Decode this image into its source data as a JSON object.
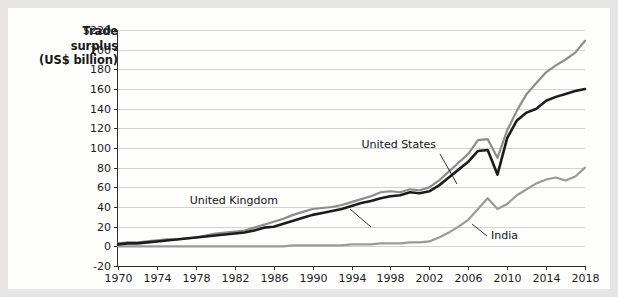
{
  "figure": {
    "axis_title_lines": [
      "Trade",
      "surplus",
      "(US$ billion)"
    ],
    "axis_title_text": "Trade surplus (US$ billion)",
    "background_color": "#e6e5e3",
    "panel_color": "#fdfdfc"
  },
  "chart_data": {
    "type": "line",
    "title": "",
    "subtitle": "",
    "xlabel": "",
    "ylabel": "Trade surplus (US$ billion)",
    "xlim": [
      1970,
      2018
    ],
    "ylim": [
      -20,
      220
    ],
    "grid": true,
    "grid_axis": "y",
    "legend": "inline-annotations",
    "legend_position": "in-plot",
    "x_tick_labels": [
      "1970",
      "1974",
      "1978",
      "1982",
      "1986",
      "1990",
      "1994",
      "1998",
      "2002",
      "2006",
      "2010",
      "2014",
      "2018"
    ],
    "x_ticks": [
      1970,
      1974,
      1978,
      1982,
      1986,
      1990,
      1994,
      1998,
      2002,
      2006,
      2010,
      2014,
      2018
    ],
    "y_tick_labels": [
      "$220",
      "200",
      "180",
      "160",
      "140",
      "120",
      "100",
      "80",
      "60",
      "40",
      "20",
      "0",
      "-20"
    ],
    "y_ticks": [
      220,
      200,
      180,
      160,
      140,
      120,
      100,
      80,
      60,
      40,
      20,
      0,
      -20
    ],
    "x": [
      1970,
      1971,
      1972,
      1973,
      1974,
      1975,
      1976,
      1977,
      1978,
      1979,
      1980,
      1981,
      1982,
      1983,
      1984,
      1985,
      1986,
      1987,
      1988,
      1989,
      1990,
      1991,
      1992,
      1993,
      1994,
      1995,
      1996,
      1997,
      1998,
      1999,
      2000,
      2001,
      2002,
      2003,
      2004,
      2005,
      2006,
      2007,
      2008,
      2009,
      2010,
      2011,
      2012,
      2013,
      2014,
      2015,
      2016,
      2017,
      2018
    ],
    "series": [
      {
        "name": "United States",
        "color": "#8c8c8c",
        "label_annotation": "United States",
        "values": [
          3,
          4,
          4,
          5,
          6,
          7,
          7,
          8,
          9,
          11,
          13,
          14,
          15,
          16,
          19,
          22,
          25,
          28,
          32,
          35,
          38,
          39,
          40,
          42,
          45,
          48,
          51,
          55,
          56,
          55,
          58,
          57,
          60,
          67,
          76,
          85,
          94,
          108,
          109,
          90,
          118,
          138,
          155,
          166,
          177,
          184,
          190,
          197,
          209
        ]
      },
      {
        "name": "United Kingdom",
        "color": "#1c1c1e",
        "label_annotation": "United Kingdom",
        "values": [
          2,
          3,
          3,
          4,
          5,
          6,
          7,
          8,
          9,
          10,
          11,
          12,
          13,
          14,
          16,
          19,
          20,
          23,
          26,
          29,
          32,
          34,
          36,
          38,
          41,
          44,
          46,
          49,
          51,
          52,
          55,
          54,
          56,
          62,
          70,
          78,
          86,
          97,
          98,
          73,
          110,
          128,
          136,
          140,
          148,
          152,
          155,
          158,
          160
        ]
      },
      {
        "name": "India",
        "color": "#9a9a9a",
        "label_annotation": "India",
        "values": [
          0,
          0,
          0,
          0,
          0,
          0,
          0,
          0,
          0,
          0,
          0,
          0,
          0,
          0,
          0,
          0,
          0,
          0,
          1,
          1,
          1,
          1,
          1,
          1,
          2,
          2,
          2,
          3,
          3,
          3,
          4,
          4,
          5,
          9,
          14,
          20,
          27,
          38,
          49,
          38,
          43,
          52,
          58,
          64,
          68,
          70,
          67,
          71,
          80
        ]
      }
    ],
    "annotations": [
      {
        "text": "United States",
        "x_px": 428,
        "y_px": 140,
        "points_to_series": "United States"
      },
      {
        "text": "United Kingdom",
        "x_px": 270,
        "y_px": 196,
        "points_to_series": "United Kingdom"
      },
      {
        "text": "India",
        "x_px": 483,
        "y_px": 231,
        "points_to_series": "India"
      }
    ]
  }
}
